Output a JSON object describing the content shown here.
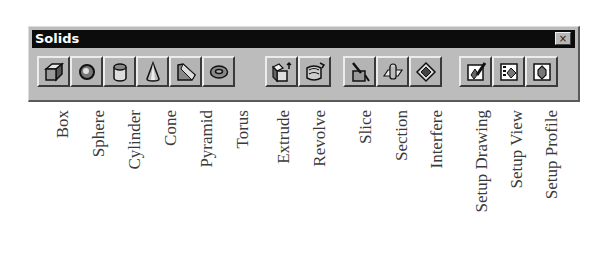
{
  "window": {
    "title": "Solids",
    "close_label": "×"
  },
  "toolbar": {
    "buttons": [
      {
        "id": "box",
        "label": "Box",
        "icon": "box-icon"
      },
      {
        "id": "sphere",
        "label": "Sphere",
        "icon": "sphere-icon"
      },
      {
        "id": "cylinder",
        "label": "Cylinder",
        "icon": "cylinder-icon"
      },
      {
        "id": "cone",
        "label": "Cone",
        "icon": "cone-icon"
      },
      {
        "id": "pyramid",
        "label": "Pyramid",
        "icon": "pyramid-icon"
      },
      {
        "id": "torus",
        "label": "Torus",
        "icon": "torus-icon"
      },
      {
        "id": "extrude",
        "label": "Extrude",
        "icon": "extrude-icon"
      },
      {
        "id": "revolve",
        "label": "Revolve",
        "icon": "revolve-icon"
      },
      {
        "id": "slice",
        "label": "Slice",
        "icon": "slice-icon"
      },
      {
        "id": "section",
        "label": "Section",
        "icon": "section-icon"
      },
      {
        "id": "interfere",
        "label": "Interfere",
        "icon": "interfere-icon"
      },
      {
        "id": "setup-drawing",
        "label": "Setup Drawing",
        "icon": "setup-drawing-icon"
      },
      {
        "id": "setup-view",
        "label": "Setup View",
        "icon": "setup-view-icon"
      },
      {
        "id": "setup-profile",
        "label": "Setup Profile",
        "icon": "setup-profile-icon"
      }
    ]
  }
}
